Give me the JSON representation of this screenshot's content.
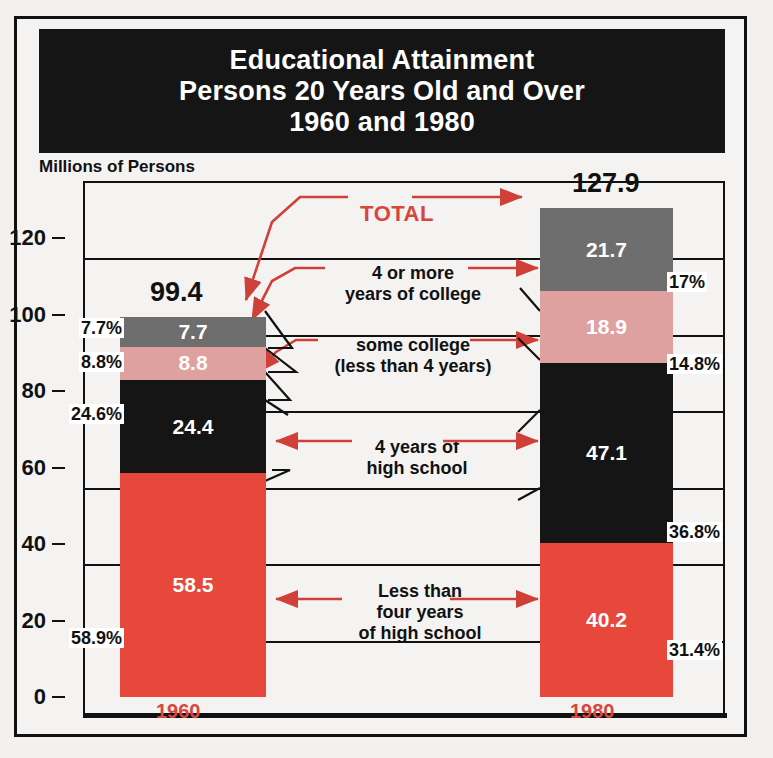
{
  "frame": {
    "title_lines": [
      "Educational Attainment",
      "Persons 20 Years Old and Over",
      "1960 and 1980"
    ],
    "units_caption": "Millions of Persons"
  },
  "colors": {
    "red": "#e8483c",
    "pink": "#dfa0a0",
    "gray": "#6e6e6e",
    "black": "#151515",
    "accent_red": "#d9453c",
    "banner_bg": "#151515"
  },
  "annotations": {
    "total_label": "TOTAL",
    "college_4plus": [
      "4 or more",
      "years of college"
    ],
    "some_college": [
      "some college",
      "(less than 4 years)"
    ],
    "hs_4years": [
      "4 years of",
      "high school"
    ],
    "less_than_hs": [
      "Less than",
      "four years",
      "of high school"
    ]
  },
  "chart_data": {
    "type": "bar",
    "title": "Educational Attainment Persons 20 Years Old and Over 1960 and 1980",
    "xlabel": "",
    "ylabel": "Millions of Persons",
    "ylim": [
      0,
      140
    ],
    "yticks": [
      0,
      20,
      40,
      60,
      80,
      100,
      120
    ],
    "ytick_labels": [
      "0",
      "20",
      "40",
      "60",
      "80",
      "100",
      "120"
    ],
    "grid": true,
    "legend_position": "center-annotations",
    "stacked": true,
    "categories": [
      "1960",
      "1980"
    ],
    "totals": [
      99.4,
      127.9
    ],
    "total_labels": [
      "99.4",
      "127.9"
    ],
    "series": [
      {
        "name": "Less than four years of high school",
        "color": "#e8483c",
        "values": [
          58.5,
          40.2
        ],
        "value_labels": [
          "58.5",
          "40.2"
        ],
        "percents": [
          58.9,
          31.4
        ],
        "percent_labels": [
          "58.9%",
          "31.4%"
        ]
      },
      {
        "name": "4 years of high school",
        "color": "#151515",
        "values": [
          24.4,
          47.1
        ],
        "value_labels": [
          "24.4",
          "47.1"
        ],
        "percents": [
          24.6,
          36.8
        ],
        "percent_labels": [
          "24.6%",
          "36.8%"
        ]
      },
      {
        "name": "some college (less than 4 years)",
        "color": "#dfa0a0",
        "values": [
          8.8,
          18.9
        ],
        "value_labels": [
          "8.8",
          "18.9"
        ],
        "percents": [
          8.8,
          14.8
        ],
        "percent_labels": [
          "8.8%",
          "14.8%"
        ]
      },
      {
        "name": "4 or more years of college",
        "color": "#6e6e6e",
        "values": [
          7.7,
          21.7
        ],
        "value_labels": [
          "7.7",
          "21.7"
        ],
        "percents": [
          7.7,
          17.0
        ],
        "percent_labels": [
          "7.7%",
          "17%"
        ]
      }
    ]
  }
}
